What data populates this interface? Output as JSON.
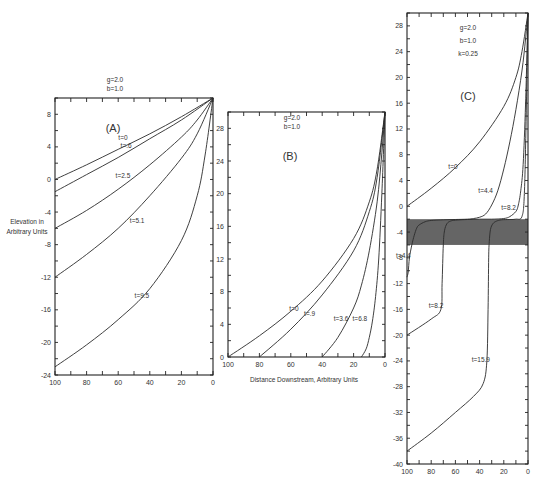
{
  "chart_data": [
    {
      "type": "line",
      "panel": "(A)",
      "title": "(A)",
      "params": [
        "g=2.0",
        "b=1.0"
      ],
      "xlabel": "",
      "ylabel": "Elevation in Arbitrary Units",
      "xlim": [
        100,
        0
      ],
      "ylim": [
        -24,
        10
      ],
      "xticks": [
        100,
        80,
        60,
        40,
        20,
        0
      ],
      "yticks": [
        8,
        4,
        0,
        -4,
        -8,
        -12,
        -16,
        -20,
        -24
      ],
      "grid": false,
      "series": [
        {
          "name": "t=0",
          "x": [
            100,
            80,
            60,
            40,
            20,
            0
          ],
          "y": [
            0,
            1.8,
            3.7,
            5.6,
            7.7,
            10
          ]
        },
        {
          "name": "t=.6",
          "x": [
            100,
            80,
            60,
            40,
            20,
            0
          ],
          "y": [
            -1.5,
            0.6,
            2.7,
            5.0,
            7.3,
            10
          ]
        },
        {
          "name": "t=2.5",
          "x": [
            100,
            80,
            60,
            40,
            20,
            10,
            0
          ],
          "y": [
            -6,
            -3.8,
            -1.2,
            1.8,
            5.2,
            7.3,
            10
          ]
        },
        {
          "name": "t=5.1",
          "x": [
            100,
            80,
            60,
            40,
            20,
            10,
            0
          ],
          "y": [
            -12,
            -9.2,
            -6.0,
            -2.0,
            2.6,
            5.6,
            10
          ]
        },
        {
          "name": "t=9.5",
          "x": [
            100,
            80,
            60,
            40,
            20,
            10,
            5,
            0
          ],
          "y": [
            -23,
            -20.3,
            -17.2,
            -13.4,
            -7.5,
            -2.0,
            3.0,
            10
          ]
        }
      ],
      "curve_labels": [
        {
          "text": "t=0",
          "x": 57,
          "y": 4.8
        },
        {
          "text": "t=.6",
          "x": 55,
          "y": 3.9
        },
        {
          "text": "t=2.5",
          "x": 57,
          "y": 0.2
        },
        {
          "text": "t=5.1",
          "x": 48,
          "y": -5.4
        },
        {
          "text": "t=9.5",
          "x": 45,
          "y": -14.5
        }
      ]
    },
    {
      "type": "line",
      "panel": "(B)",
      "title": "(B)",
      "params": [
        "g=2.0",
        "b=1.0"
      ],
      "xlabel": "Distance Downstream, Arbitrary Units",
      "ylabel": "",
      "xlim": [
        100,
        0
      ],
      "ylim": [
        0,
        30
      ],
      "xticks": [
        100,
        80,
        60,
        40,
        20,
        0
      ],
      "yticks": [
        0,
        4,
        8,
        12,
        16,
        20,
        24,
        28
      ],
      "grid": false,
      "series": [
        {
          "name": "t=0",
          "x": [
            100,
            80,
            60,
            40,
            20,
            10,
            5,
            0
          ],
          "y": [
            0,
            2.6,
            5.6,
            9.3,
            14.5,
            19,
            23,
            30
          ]
        },
        {
          "name": "t=.9",
          "x": [
            80,
            60,
            40,
            20,
            10,
            5,
            0
          ],
          "y": [
            0,
            3.4,
            7.6,
            13.0,
            17.8,
            22,
            30
          ]
        },
        {
          "name": "t=3.6",
          "x": [
            40,
            30,
            20,
            15,
            10,
            5,
            2,
            0
          ],
          "y": [
            0,
            2.4,
            6.0,
            8.8,
            13.0,
            19,
            25,
            30
          ]
        },
        {
          "name": "t=6.8",
          "x": [
            15,
            12,
            10,
            8,
            6,
            4,
            2,
            0
          ],
          "y": [
            0,
            1.0,
            2.4,
            4.4,
            7.4,
            12,
            20,
            30
          ]
        }
      ],
      "curve_labels": [
        {
          "text": "t=0",
          "x": 58,
          "y": 5.6
        },
        {
          "text": "t=.9",
          "x": 48,
          "y": 5.0
        },
        {
          "text": "t=3.6",
          "x": 28,
          "y": 4.4
        },
        {
          "text": "t=6.8",
          "x": 16,
          "y": 4.4
        }
      ]
    },
    {
      "type": "line",
      "panel": "(C)",
      "title": "(C)",
      "params": [
        "g=2.0",
        "b=1.0",
        "k=0.25"
      ],
      "xlabel": "",
      "ylabel": "",
      "xlim": [
        100,
        0
      ],
      "ylim": [
        -40,
        30
      ],
      "xticks": [
        100,
        80,
        60,
        40,
        20,
        0
      ],
      "yticks": [
        28,
        24,
        20,
        16,
        12,
        8,
        4,
        0,
        -4,
        -8,
        -12,
        -16,
        -20,
        -24,
        -28,
        -32,
        -36,
        -40
      ],
      "grid": false,
      "shaded_band": {
        "ymin": -6,
        "ymax": -2,
        "color": "#4a4a4a"
      },
      "series": [
        {
          "name": "t=0",
          "x": [
            100,
            80,
            60,
            40,
            20,
            10,
            5,
            0
          ],
          "y": [
            0,
            2.8,
            6.0,
            10.0,
            15.5,
            20,
            24,
            30
          ]
        },
        {
          "name": "t=4.4",
          "x": [
            100,
            99,
            98,
            96,
            94,
            92,
            90,
            85,
            80,
            70,
            60,
            50,
            45,
            40,
            35,
            30,
            25,
            20,
            15,
            10,
            5,
            2,
            0
          ],
          "y": [
            -11,
            -10.2,
            -8,
            -6,
            -4.5,
            -3.4,
            -2.9,
            -2.4,
            -2.2,
            -2.1,
            -2.05,
            -2.0,
            -1.9,
            -1.7,
            -1.2,
            0.2,
            2.4,
            5.8,
            10.0,
            15.0,
            21,
            26,
            30
          ]
        },
        {
          "name": "t=8.2",
          "x": [
            100,
            80,
            72,
            71,
            70,
            69,
            67,
            64,
            60,
            50,
            40,
            30,
            20,
            15,
            10,
            8,
            6,
            4,
            2,
            0
          ],
          "y": [
            -20,
            -17.5,
            -16,
            -12,
            -6,
            -3.8,
            -2.7,
            -2.3,
            -2.15,
            -2.05,
            -2.0,
            -2.0,
            -1.9,
            -1.6,
            -0.8,
            0.2,
            2.4,
            6.5,
            16,
            30
          ]
        },
        {
          "name": "t=15.9",
          "x": [
            100,
            80,
            60,
            45,
            37,
            34,
            33,
            32.5,
            32,
            31,
            29,
            26,
            22,
            15,
            10,
            5,
            3,
            1.5,
            0
          ],
          "y": [
            -38,
            -35.2,
            -32.0,
            -29.5,
            -27.5,
            -24,
            -16,
            -8,
            -5.5,
            -3.6,
            -2.7,
            -2.3,
            -2.1,
            -2.05,
            -2.0,
            -1.6,
            2.0,
            14,
            30
          ]
        }
      ],
      "curve_labels": [
        {
          "text": "t=0",
          "x": 62,
          "y": 5.8
        },
        {
          "text": "t=4.4",
          "x": 35,
          "y": 2.0
        },
        {
          "text": "t=8.2",
          "x": 16,
          "y": -0.5
        },
        {
          "text": "t=4.4",
          "x": 103,
          "y": -8.0
        },
        {
          "text": "t=8.2",
          "x": 76,
          "y": -15.8
        },
        {
          "text": "t=15.9",
          "x": 39,
          "y": -24.2
        }
      ]
    }
  ],
  "layout": {
    "panels": [
      {
        "x0": 55,
        "x1": 213,
        "y0": 98,
        "y1": 375
      },
      {
        "x0": 228,
        "x1": 385,
        "y0": 112,
        "y1": 357
      },
      {
        "x0": 407,
        "x1": 528,
        "y0": 13,
        "y1": 464
      }
    ],
    "panel_title_pos": [
      [
        113,
        132
      ],
      [
        290,
        160
      ],
      [
        468,
        100
      ]
    ],
    "param_pos": [
      [
        115,
        82
      ],
      [
        292,
        120
      ],
      [
        468,
        30
      ]
    ],
    "ylabel_pos": [
      27,
      224
    ],
    "xlabel_pos": [
      304,
      382
    ]
  },
  "text": {
    "ylabel_line1": "Elevation in",
    "ylabel_line2": "Arbitrary Units",
    "xlabel": "Distance Downstream, Arbitrary Units"
  }
}
